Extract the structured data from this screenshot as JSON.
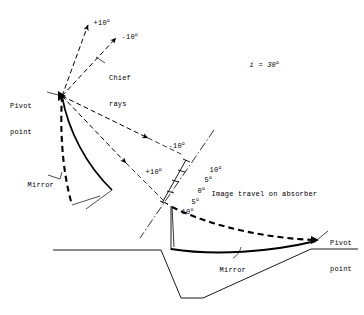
{
  "figure": {
    "title_text": "",
    "incidence_label": "i = 30",
    "incidence_unit": "o",
    "background_color": "#ffffff",
    "ink_color": "#000000"
  },
  "labels": {
    "chief_ray_plus10": "+10",
    "chief_ray_minus10": "-10",
    "chief_rays_annotation_line1": "Chief",
    "chief_rays_annotation_line2": "rays",
    "pivot_point_upper_line1": "Pivot",
    "pivot_point_upper_line2": "point",
    "pivot_point_lower_line1": "Pivot",
    "pivot_point_lower_line2": "point",
    "mirror_left": "Mirror",
    "mirror_bottom": "Mirror",
    "reflected_minus10": "-10",
    "reflected_plus10": "+10",
    "image_travel": "Image travel on absorber",
    "degree_symbol": "o"
  },
  "absorber_scale": {
    "ticks": [
      {
        "label": "10",
        "unit": "o",
        "position": "upper-outer"
      },
      {
        "label": "5",
        "unit": "o",
        "position": "upper-inner"
      },
      {
        "label": "0",
        "unit": "o",
        "position": "center"
      },
      {
        "label": "5",
        "unit": "o",
        "position": "lower-inner"
      },
      {
        "label": "10",
        "unit": "o",
        "position": "lower-outer"
      }
    ]
  },
  "geometry": {
    "pivot_upper": {
      "x": 62,
      "y": 96
    },
    "pivot_lower": {
      "x": 318,
      "y": 240
    },
    "ground_line_y": 250,
    "incidence_angle_deg": 30,
    "chief_ray_angles_deg": [
      10,
      -10
    ]
  }
}
